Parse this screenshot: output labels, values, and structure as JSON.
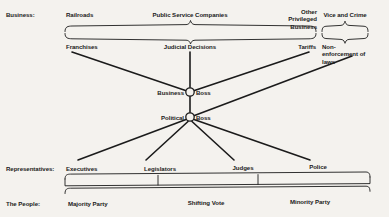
{
  "diagram": {
    "background_color": "#f4f2ee",
    "ink_color": "#1b1b1b",
    "row_labels": {
      "business": "Business:",
      "representatives": "Representatives:",
      "people": "The People:"
    },
    "row_business": {
      "items": [
        {
          "label": "Railroads",
          "x": 92,
          "y": 14
        },
        {
          "label": "Public Service Companies",
          "x": 215,
          "y": 14
        },
        {
          "label": "Other Privileged Business",
          "x": 330,
          "y": 14
        },
        {
          "label": "Vice and Crime",
          "x": 365,
          "y": 14
        }
      ]
    },
    "row_instruments": {
      "items": [
        {
          "label": "Franchises",
          "x": 92,
          "y": 45
        },
        {
          "label": "Judicial Decisions",
          "x": 196,
          "y": 45
        },
        {
          "label": "Tariffs",
          "x": 305,
          "y": 45
        },
        {
          "label": "Non-enforcement of laws",
          "x": 358,
          "y": 45
        }
      ]
    },
    "bosses": [
      {
        "prefix": "Business",
        "suffix": "Boss",
        "cx": 190,
        "cy": 92,
        "r": 4.2
      },
      {
        "prefix": "Political",
        "suffix": "Boss",
        "cx": 190,
        "cy": 117,
        "r": 4.2
      }
    ],
    "row_representatives": {
      "items": [
        {
          "label": "Executives",
          "x": 92,
          "y": 168
        },
        {
          "label": "Legislators",
          "x": 160,
          "y": 168
        },
        {
          "label": "Judges",
          "x": 243,
          "y": 168
        },
        {
          "label": "Police",
          "x": 318,
          "y": 168
        }
      ]
    },
    "row_people": {
      "items": [
        {
          "label": "Majority Party",
          "x": 102,
          "y": 203
        },
        {
          "label": "Shifting Vote",
          "x": 206,
          "y": 203
        },
        {
          "label": "Minority Party",
          "x": 310,
          "y": 203
        }
      ]
    },
    "braces": {
      "top_left_label": "brace-business-top",
      "top_right_label": "brace-vice-top",
      "mid_left_label": "brace-instruments",
      "mid_right_label": "brace-nonenforcement",
      "representatives_label": "bracket-representatives",
      "people_label": "brace-people"
    },
    "connections": [
      "franchises-to-business-boss",
      "judicial-decisions-to-business-boss",
      "tariffs-to-business-boss",
      "nonenforcement-to-political-boss",
      "business-boss-to-political-boss",
      "political-boss-to-executives",
      "political-boss-to-legislators",
      "political-boss-to-judges",
      "political-boss-to-police"
    ]
  }
}
